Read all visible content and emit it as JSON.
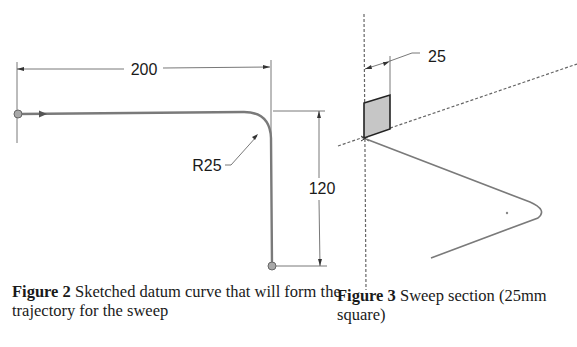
{
  "figure2": {
    "dimensions": {
      "horizontal_length": "200",
      "fillet_radius": "R25",
      "vertical_length": "120"
    },
    "caption": {
      "label": "Figure 2",
      "text": " Sketched datum curve that will form the trajectory for the sweep"
    }
  },
  "figure3": {
    "dimensions": {
      "section_size": "25"
    },
    "caption": {
      "label": "Figure 3",
      "text": " Sweep section (25mm square)"
    }
  }
}
